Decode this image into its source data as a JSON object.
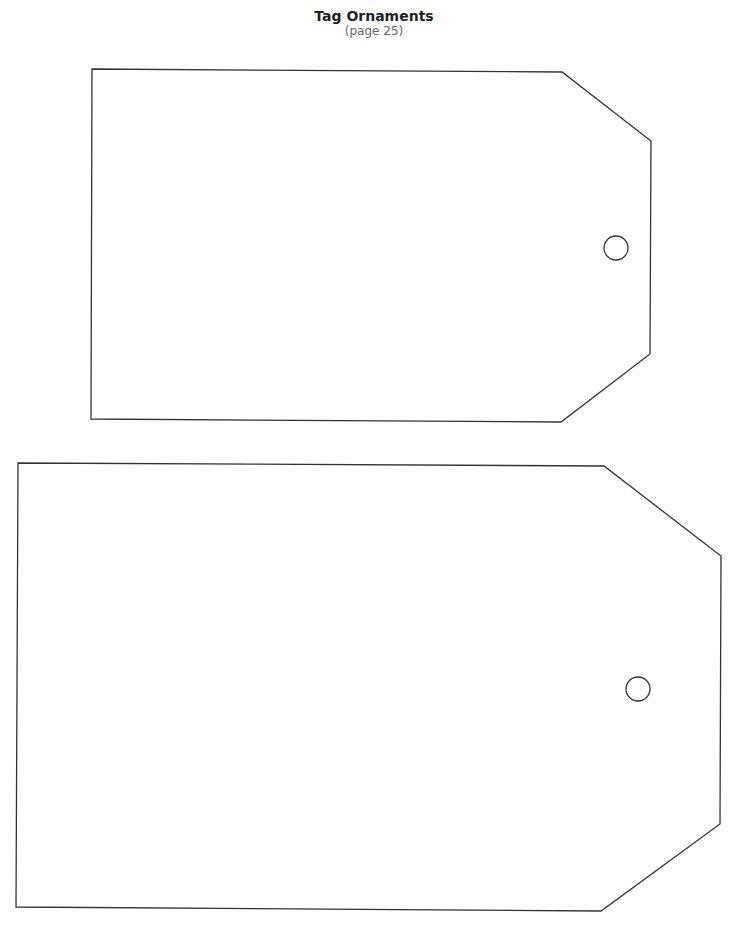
{
  "header": {
    "title": "Tag Ornaments",
    "subtitle": "(page 25)"
  },
  "tags": [
    {
      "name": "small-tag",
      "points": "92,69 562,72 651,141 650,354 561,422 91,419",
      "hole": {
        "cx": 616,
        "cy": 248,
        "r": 12
      }
    },
    {
      "name": "large-tag",
      "points": "18,463 604,466 721,556 720,824 601,911 16,907",
      "hole": {
        "cx": 638,
        "cy": 689,
        "r": 12
      }
    }
  ],
  "colors": {
    "outline": "#333333",
    "background": "#ffffff"
  }
}
